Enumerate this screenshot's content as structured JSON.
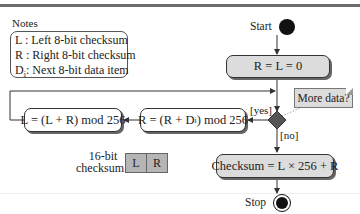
{
  "notes": {
    "title": "Notes",
    "items": [
      {
        "symbol": "L",
        "text": "L : Left 8-bit checksum"
      },
      {
        "symbol": "R",
        "text": "R : Right 8-bit checksum"
      },
      {
        "symbol": "Di",
        "text_prefix": "D",
        "text_sub": "i",
        "text_suffix": ": Next 8-bit data item"
      }
    ]
  },
  "flow": {
    "start_label": "Start",
    "init": "R = L = 0",
    "decision_note": "More data?",
    "yes_label": "[yes]",
    "no_label": "[no]",
    "update_r_prefix": "R = (R + D",
    "update_r_sub": "i",
    "update_r_suffix": ") mod 256",
    "update_l": "L = (L + R) mod 256",
    "final": "Checksum = L × 256 + R",
    "stop_label": "Stop"
  },
  "checksum16": {
    "label_line1": "16-bit",
    "label_line2": "checksum",
    "cells": [
      "L",
      "R"
    ]
  },
  "colors": {
    "activity_fill": "#dcdcdc",
    "decision_fill": "#555555",
    "cell_fill": "#b5b5b5",
    "node_fill": "#111111"
  }
}
